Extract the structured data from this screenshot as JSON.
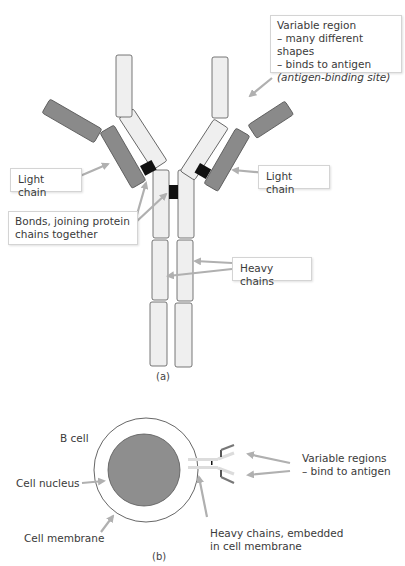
{
  "panel_a": {
    "caption": "(a)",
    "labels": {
      "variable_region": {
        "line1": "Variable region",
        "line2": "– many different shapes",
        "line3": "– binds to antigen",
        "line4": "(antigen-binding site)"
      },
      "light_chain_left": "Light chain",
      "light_chain_right": "Light chain",
      "bonds": {
        "line1": "Bonds, joining protein",
        "line2": "chains together"
      },
      "heavy_chains": "Heavy chains"
    }
  },
  "panel_b": {
    "caption": "(b)",
    "labels": {
      "b_cell": "B cell",
      "cell_nucleus": "Cell nucleus",
      "cell_membrane": "Cell membrane",
      "variable_regions": {
        "line1": "Variable regions",
        "line2": "– bind to antigen"
      },
      "heavy_chains_embedded": {
        "line1": "Heavy chains, embedded",
        "line2": "in cell membrane"
      }
    }
  },
  "colors": {
    "heavy_chain_fill": "#efefef",
    "light_chain_fill": "#8a8a8a",
    "bond_fill": "#111111",
    "nucleus_fill": "#8e8e8e",
    "arrow": "#b0b0b0",
    "outline": "#555555"
  }
}
